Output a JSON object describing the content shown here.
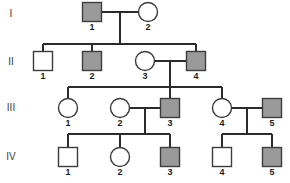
{
  "figure": {
    "kind": "pedigree-chart",
    "width": 290,
    "height": 183,
    "background_color": "#ffffff",
    "line_color": "#2b2b2b",
    "symbol_stroke_color": "#3c3c3c",
    "affected_fill_color": "#9a9a9a",
    "unaffected_fill_color": "#ffffff"
  },
  "generation_labels": [
    {
      "id": "gen-I",
      "text": "I",
      "x": 11,
      "y": 14
    },
    {
      "id": "gen-II",
      "text": "II",
      "x": 11,
      "y": 62
    },
    {
      "id": "gen-III",
      "text": "III",
      "x": 11,
      "y": 108
    },
    {
      "id": "gen-IV",
      "text": "IV",
      "x": 11,
      "y": 157
    }
  ],
  "individuals": [
    {
      "key": "I-1",
      "generation": "I",
      "number": "1",
      "sex": "male",
      "shape": "square",
      "affected": true,
      "cx": 92,
      "cy": 12,
      "size": 19
    },
    {
      "key": "I-2",
      "generation": "I",
      "number": "2",
      "sex": "female",
      "shape": "circle",
      "affected": false,
      "cx": 148,
      "cy": 12,
      "size": 19
    },
    {
      "key": "II-1",
      "generation": "II",
      "number": "1",
      "sex": "male",
      "shape": "square",
      "affected": false,
      "cx": 43,
      "cy": 61,
      "size": 19
    },
    {
      "key": "II-2",
      "generation": "II",
      "number": "2",
      "sex": "male",
      "shape": "square",
      "affected": true,
      "cx": 92,
      "cy": 61,
      "size": 19
    },
    {
      "key": "II-3",
      "generation": "II",
      "number": "3",
      "sex": "female",
      "shape": "circle",
      "affected": false,
      "cx": 145,
      "cy": 61,
      "size": 19
    },
    {
      "key": "II-4",
      "generation": "II",
      "number": "4",
      "sex": "male",
      "shape": "square",
      "affected": true,
      "cx": 196,
      "cy": 61,
      "size": 19
    },
    {
      "key": "III-1",
      "generation": "III",
      "number": "1",
      "sex": "female",
      "shape": "circle",
      "affected": false,
      "cx": 68,
      "cy": 108,
      "size": 19
    },
    {
      "key": "III-2",
      "generation": "III",
      "number": "2",
      "sex": "female",
      "shape": "circle",
      "affected": false,
      "cx": 120,
      "cy": 108,
      "size": 19
    },
    {
      "key": "III-3",
      "generation": "III",
      "number": "3",
      "sex": "male",
      "shape": "square",
      "affected": true,
      "cx": 170,
      "cy": 108,
      "size": 19
    },
    {
      "key": "III-4",
      "generation": "III",
      "number": "4",
      "sex": "female",
      "shape": "circle",
      "affected": false,
      "cx": 222,
      "cy": 108,
      "size": 19
    },
    {
      "key": "III-5",
      "generation": "III",
      "number": "5",
      "sex": "male",
      "shape": "square",
      "affected": true,
      "cx": 272,
      "cy": 108,
      "size": 19
    },
    {
      "key": "IV-1",
      "generation": "IV",
      "number": "1",
      "sex": "male",
      "shape": "square",
      "affected": false,
      "cx": 68,
      "cy": 157,
      "size": 19
    },
    {
      "key": "IV-2",
      "generation": "IV",
      "number": "2",
      "sex": "female",
      "shape": "circle",
      "affected": false,
      "cx": 120,
      "cy": 157,
      "size": 19
    },
    {
      "key": "IV-3",
      "generation": "IV",
      "number": "3",
      "sex": "male",
      "shape": "square",
      "affected": true,
      "cx": 170,
      "cy": 157,
      "size": 19
    },
    {
      "key": "IV-4",
      "generation": "IV",
      "number": "4",
      "sex": "male",
      "shape": "square",
      "affected": false,
      "cx": 222,
      "cy": 157,
      "size": 19
    },
    {
      "key": "IV-5",
      "generation": "IV",
      "number": "5",
      "sex": "male",
      "shape": "square",
      "affected": true,
      "cx": 272,
      "cy": 157,
      "size": 19
    }
  ],
  "connections": [
    {
      "name": "mating-line-I1-I2",
      "type": "mating",
      "d": "M101.5 12 L138.5 12"
    },
    {
      "name": "descent-I1-I2",
      "type": "descent",
      "d": "M120 12 L120 44"
    },
    {
      "name": "sibship-line-gen-II",
      "type": "sibship",
      "d": "M43 44 L196 44"
    },
    {
      "name": "drop-to-II-1",
      "type": "drop",
      "d": "M43 44 L43 51.5"
    },
    {
      "name": "drop-to-II-2",
      "type": "drop",
      "d": "M92 44 L92 51.5"
    },
    {
      "name": "drop-to-II-4",
      "type": "drop",
      "d": "M196 44 L196 51.5"
    },
    {
      "name": "mating-line-II3-II4",
      "type": "mating",
      "d": "M154.5 61 L186.5 61"
    },
    {
      "name": "descent-II3-II4",
      "type": "descent",
      "d": "M170 61 L170 87"
    },
    {
      "name": "sibship-line-gen-III",
      "type": "sibship",
      "d": "M68 87 L222 87"
    },
    {
      "name": "drop-to-III-1",
      "type": "drop",
      "d": "M68 87 L68 98.5"
    },
    {
      "name": "drop-to-III-3",
      "type": "drop",
      "d": "M170 87 L170 98.5"
    },
    {
      "name": "drop-to-III-4",
      "type": "drop",
      "d": "M222 87 L222 98.5"
    },
    {
      "name": "mating-line-III2-III3",
      "type": "mating",
      "d": "M129.5 108 L160.5 108"
    },
    {
      "name": "descent-III2-III3",
      "type": "descent",
      "d": "M145 108 L145 134"
    },
    {
      "name": "sibship-line-gen-IV-left",
      "type": "sibship",
      "d": "M68 134 L170 134"
    },
    {
      "name": "drop-to-IV-1",
      "type": "drop",
      "d": "M68 134 L68 147.5"
    },
    {
      "name": "drop-to-IV-2",
      "type": "drop",
      "d": "M120 134 L120 147.5"
    },
    {
      "name": "drop-to-IV-3",
      "type": "drop",
      "d": "M170 134 L170 147.5"
    },
    {
      "name": "mating-line-III4-III5",
      "type": "mating",
      "d": "M231.5 108 L262.5 108"
    },
    {
      "name": "descent-III4-III5",
      "type": "descent",
      "d": "M247 108 L247 134"
    },
    {
      "name": "sibship-line-gen-IV-right",
      "type": "sibship",
      "d": "M222 134 L272 134"
    },
    {
      "name": "drop-to-IV-4",
      "type": "drop",
      "d": "M222 134 L222 147.5"
    },
    {
      "name": "drop-to-IV-5",
      "type": "drop",
      "d": "M272 134 L272 147.5"
    }
  ]
}
